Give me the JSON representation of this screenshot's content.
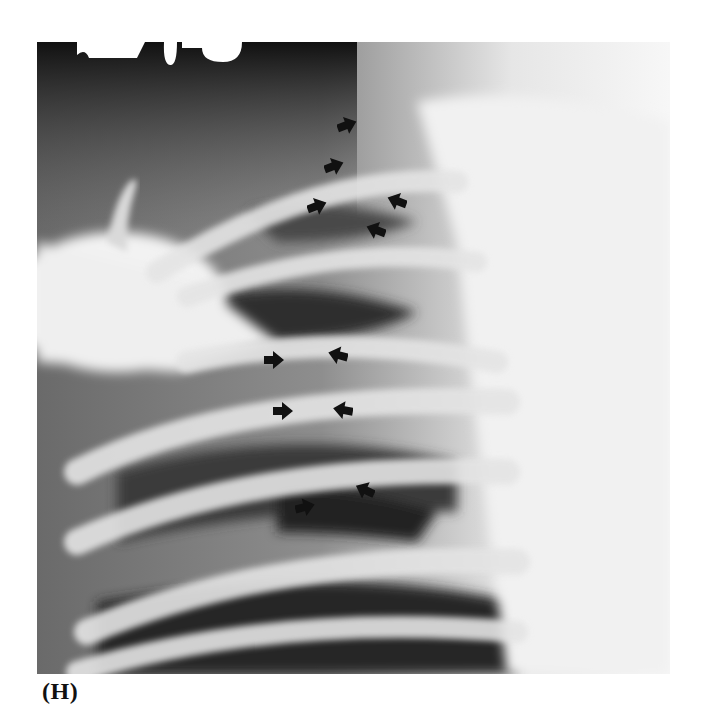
{
  "figure": {
    "panel_label": "(H)",
    "arrows": [
      {
        "x": 346,
        "y": 125,
        "dir": "right"
      },
      {
        "x": 333,
        "y": 166,
        "dir": "right"
      },
      {
        "x": 316,
        "y": 206,
        "dir": "right"
      },
      {
        "x": 396,
        "y": 201,
        "dir": "left"
      },
      {
        "x": 375,
        "y": 230,
        "dir": "left"
      },
      {
        "x": 272,
        "y": 360,
        "dir": "right"
      },
      {
        "x": 337,
        "y": 355,
        "dir": "left"
      },
      {
        "x": 282,
        "y": 411,
        "dir": "right"
      },
      {
        "x": 342,
        "y": 410,
        "dir": "left"
      },
      {
        "x": 304,
        "y": 507,
        "dir": "right"
      },
      {
        "x": 364,
        "y": 490,
        "dir": "left"
      }
    ]
  }
}
